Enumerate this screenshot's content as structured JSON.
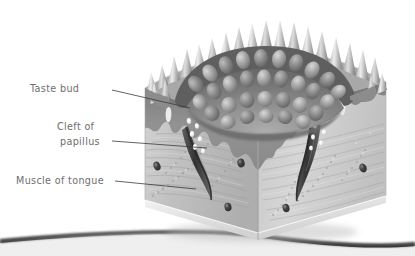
{
  "figure": {
    "type": "anatomical-illustration",
    "style": "grayscale airbrush rendering",
    "canvas": {
      "width": 415,
      "height": 256,
      "background": "#ffffff"
    }
  },
  "labels": [
    {
      "id": "taste-bud",
      "text": "Taste bud",
      "x": 30,
      "y": 92,
      "anchor": "start",
      "leader": {
        "x1": 112,
        "y1": 90,
        "x2": 190,
        "y2": 108
      },
      "target": "white oval taste bud in epithelium lining the cleft"
    },
    {
      "id": "cleft-of-papillus",
      "text_line_1": "Cleft of",
      "text_line_2": "papillus",
      "x": 57,
      "y": 130,
      "x2": 60,
      "y2": 145,
      "anchor": "start",
      "leader": {
        "x1": 112,
        "y1": 141,
        "x2": 207,
        "y2": 148
      },
      "target": "dark trench between papilla wall and surrounding epithelium"
    },
    {
      "id": "muscle-of-tongue",
      "text": "Muscle of tongue",
      "x": 16,
      "y": 184,
      "anchor": "start",
      "leader": {
        "x1": 115,
        "y1": 181,
        "x2": 196,
        "y2": 189
      },
      "target": "striated muscle fibres forming the body of the block"
    }
  ],
  "colors": {
    "label_text": "#6e6e6e",
    "leader_line": "#3a3a3a",
    "face_left": "#bdbdbd",
    "face_right": "#cfcfcf",
    "epithelium": "#8d8d8d",
    "epithelium_dark": "#6a6a6a",
    "papilla_dome": "#777777",
    "papilla_dome_light": "#ababab",
    "spike_light": "#e2e2e2",
    "spike_dark": "#8a8a8a",
    "taste_bud": "#fbfbfb",
    "nucleus": "#4a4a4a",
    "cleft_dark": "#3f3f3f",
    "base_shadow": "#2a2a2a",
    "background": "#ffffff"
  },
  "structures": {
    "filiform_papillae_spikes": 26,
    "vallate_dome_bump_rows": 3,
    "taste_buds_visible": 16,
    "muscle_nuclei_visible": 5,
    "nerve_fibre_tracks": 4,
    "block_faces": 2,
    "block_face_names": [
      "left cut face",
      "right cut face"
    ]
  }
}
